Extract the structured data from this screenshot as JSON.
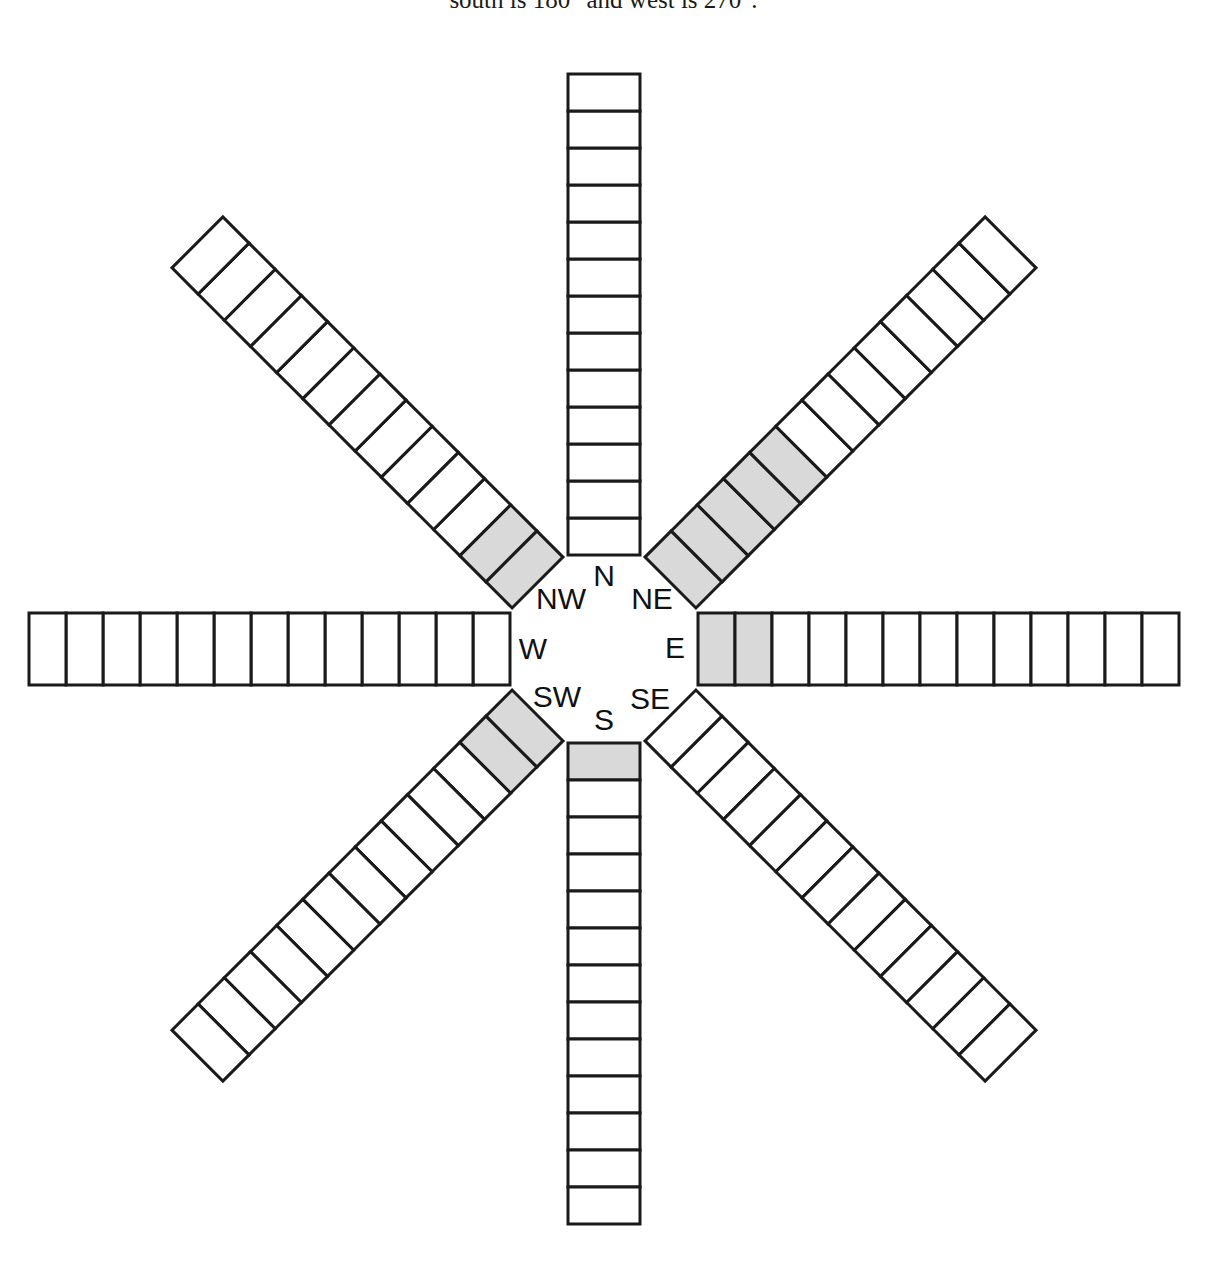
{
  "caption": {
    "text": "south is 180° and west is 270°."
  },
  "figure": {
    "name": "wind-rose-compass-grid",
    "cell_colors": {
      "empty": "#ffffff",
      "filled": "#d9d9d9",
      "stroke": "#1a1a1a",
      "hub": "#ffffff"
    },
    "hub": {
      "center_x": 604,
      "center_y": 649,
      "radius": 95
    },
    "geometry": {
      "cell_length": 37,
      "ray_half_width": 36,
      "inner_offset": 94
    },
    "direction_labels": [
      {
        "key": "N",
        "text": "N",
        "x": 604,
        "y": 578,
        "bearing": 0
      },
      {
        "key": "NE",
        "text": "NE",
        "x": 652,
        "y": 601,
        "bearing": 45
      },
      {
        "key": "E",
        "text": "E",
        "x": 675,
        "y": 650,
        "bearing": 90
      },
      {
        "key": "SE",
        "text": "SE",
        "x": 650,
        "y": 701,
        "bearing": 135
      },
      {
        "key": "S",
        "text": "S",
        "x": 604,
        "y": 722,
        "bearing": 180
      },
      {
        "key": "SW",
        "text": "SW",
        "x": 557,
        "y": 699,
        "bearing": 225
      },
      {
        "key": "W",
        "text": "W",
        "x": 533,
        "y": 651,
        "bearing": 270
      },
      {
        "key": "NW",
        "text": "NW",
        "x": 561,
        "y": 601,
        "bearing": 315
      }
    ]
  },
  "chart_data": {
    "type": "bar",
    "xlabel": "Compass direction",
    "ylabel": "Number of shaded cells",
    "categories": [
      "N",
      "NE",
      "E",
      "SE",
      "S",
      "SW",
      "W",
      "NW"
    ],
    "values": [
      0,
      5,
      2,
      0,
      1,
      2,
      0,
      2
    ],
    "cells_per_ray": 13,
    "bearings_deg": [
      0,
      45,
      90,
      135,
      180,
      225,
      270,
      315
    ],
    "series": [
      {
        "name": "Shaded (filled) cells",
        "values": [
          0,
          5,
          2,
          0,
          1,
          2,
          0,
          2
        ]
      },
      {
        "name": "Unshaded (empty) cells",
        "values": [
          13,
          8,
          11,
          13,
          12,
          11,
          13,
          11
        ]
      }
    ],
    "ylim": [
      0,
      13
    ],
    "grid": false,
    "legend": "none",
    "annotations": [
      "south is 180° and west is 270°."
    ]
  }
}
